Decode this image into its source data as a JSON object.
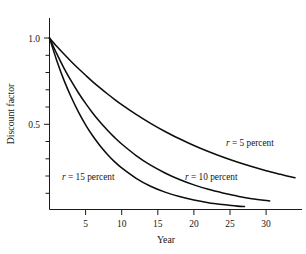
{
  "chart_data": {
    "type": "line",
    "title": "",
    "subtitle": "",
    "xlabel": "Year",
    "ylabel": "Discount factor",
    "xlim": [
      0,
      35.5
    ],
    "ylim": [
      0,
      1.08
    ],
    "grid": false,
    "legend_position": "inline-annotations",
    "x_ticks": [
      5,
      10,
      15,
      20,
      25,
      30
    ],
    "x_tick_labels": [
      "5",
      "10",
      "15",
      "20",
      "25",
      "30"
    ],
    "x_minor_ticks": [],
    "y_ticks": [
      0.1,
      0.2,
      0.3,
      0.4,
      0.5,
      0.6,
      0.7,
      0.8,
      0.9,
      1.0
    ],
    "y_tick_labels": [
      "",
      "",
      "",
      "",
      "0.5",
      "",
      "",
      "",
      "",
      "1.0"
    ],
    "y_labeled_ticks": [
      {
        "value": 1.0,
        "label": "1.0"
      },
      {
        "value": 0.5,
        "label": "0.5"
      }
    ],
    "series": [
      {
        "name": "r = 5 percent",
        "rate_percent": 5,
        "formula": "1 / (1 + 0.05)^t",
        "x": [
          0,
          1,
          2,
          3,
          4,
          5,
          6,
          7,
          8,
          9,
          10,
          12,
          14,
          16,
          18,
          20,
          22,
          24,
          26,
          28,
          30,
          32,
          34
        ],
        "values": [
          1.0,
          0.952,
          0.907,
          0.864,
          0.823,
          0.784,
          0.746,
          0.711,
          0.677,
          0.645,
          0.614,
          0.557,
          0.505,
          0.458,
          0.416,
          0.377,
          0.342,
          0.31,
          0.281,
          0.255,
          0.231,
          0.21,
          0.19
        ],
        "annotation": {
          "text_parts": [
            "r",
            " = 5 percent"
          ],
          "x": 24.5,
          "y": 0.435
        }
      },
      {
        "name": "r = 10 percent",
        "rate_percent": 10,
        "formula": "1 / (1 + 0.10)^t",
        "x": [
          0,
          1,
          2,
          3,
          4,
          5,
          6,
          7,
          8,
          9,
          10,
          12,
          14,
          16,
          18,
          20,
          22,
          24,
          26,
          28,
          30.5
        ],
        "values": [
          1.0,
          0.909,
          0.826,
          0.751,
          0.683,
          0.621,
          0.564,
          0.513,
          0.467,
          0.424,
          0.386,
          0.319,
          0.263,
          0.218,
          0.18,
          0.149,
          0.123,
          0.102,
          0.084,
          0.069,
          0.056
        ],
        "annotation": {
          "text_parts": [
            "r",
            " = 10 percent"
          ],
          "x": 19.0,
          "y": 0.2
        }
      },
      {
        "name": "r = 15 percent",
        "rate_percent": 15,
        "formula": "1 / (1 + 0.15)^t",
        "x": [
          0,
          1,
          2,
          3,
          4,
          5,
          6,
          7,
          8,
          9,
          10,
          12,
          14,
          16,
          18,
          20,
          22,
          24,
          26,
          27
        ],
        "values": [
          1.0,
          0.87,
          0.756,
          0.658,
          0.572,
          0.497,
          0.432,
          0.376,
          0.327,
          0.284,
          0.247,
          0.187,
          0.141,
          0.107,
          0.081,
          0.061,
          0.046,
          0.035,
          0.026,
          0.024
        ],
        "annotation": {
          "text_parts": [
            "r",
            " = 15 percent"
          ],
          "x": 2.0,
          "y": 0.2
        }
      }
    ],
    "annotations": [
      {
        "id": "ann-5",
        "text": "r = 5 percent"
      },
      {
        "id": "ann-10",
        "text": "r = 10 percent"
      },
      {
        "id": "ann-15",
        "text": "r = 15 percent"
      }
    ],
    "colors": {
      "curve": "#0d0d0d",
      "axis": "#1a1a1a",
      "text": "#151515",
      "background": "#ffffff"
    }
  }
}
